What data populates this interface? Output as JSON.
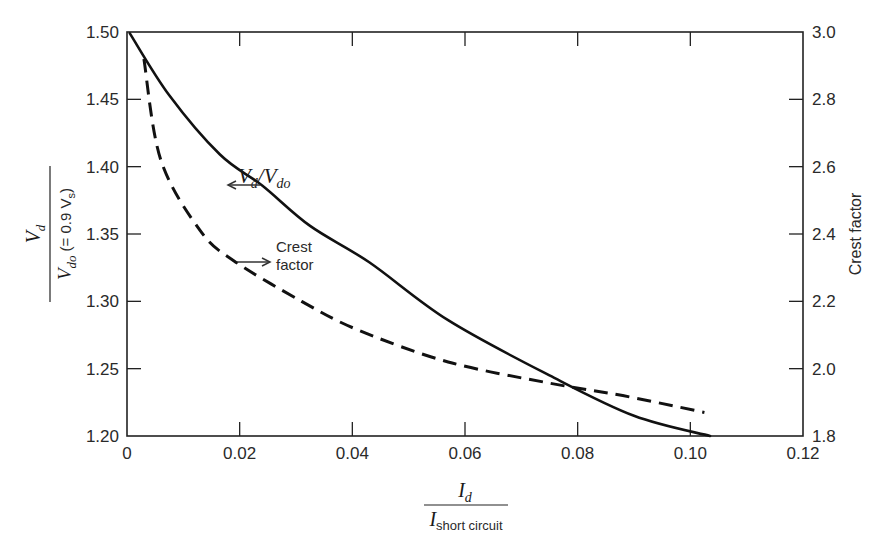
{
  "chart_data": {
    "type": "line",
    "title": "",
    "xlabel": "I_d / I_short circuit",
    "xlabel_parts": {
      "num": "I",
      "num_sub": "d",
      "den": "I",
      "den_sub": "short circuit"
    },
    "ylabel_left": "V_d / V_do (= 0.9 V_s)",
    "ylabel_left_parts": {
      "num": "V",
      "num_sub": "d",
      "den": "V",
      "den_sub": "do",
      "den_suffix": "(= 0.9 V",
      "den_suffix_sub": "s",
      "den_close": ")"
    },
    "ylabel_right": "Crest factor",
    "xlim": [
      0,
      0.12
    ],
    "ylim_left": [
      1.2,
      1.5
    ],
    "ylim_right": [
      1.8,
      3.0
    ],
    "x_ticks": [
      "0",
      "0.02",
      "0.04",
      "0.06",
      "0.08",
      "0.10",
      "0.12"
    ],
    "x_tick_values": [
      0,
      0.02,
      0.04,
      0.06,
      0.08,
      0.1,
      0.12
    ],
    "y_left_ticks": [
      "1.50",
      "1.45",
      "1.40",
      "1.35",
      "1.30",
      "1.25",
      "1.20"
    ],
    "y_left_tick_values": [
      1.5,
      1.45,
      1.4,
      1.35,
      1.3,
      1.25,
      1.2
    ],
    "y_right_ticks": [
      "3.0",
      "2.8",
      "2.6",
      "2.4",
      "2.2",
      "2.0",
      "1.8"
    ],
    "y_right_tick_values": [
      3.0,
      2.8,
      2.6,
      2.4,
      2.2,
      2.0,
      1.8
    ],
    "grid": false,
    "series": [
      {
        "name": "Vd/Vdo",
        "axis": "left",
        "style": "solid",
        "x": [
          0.0005,
          0.0075,
          0.0165,
          0.024,
          0.0325,
          0.043,
          0.057,
          0.075,
          0.09,
          0.1035
        ],
        "y": [
          1.499,
          1.453,
          1.409,
          1.386,
          1.356,
          1.329,
          1.286,
          1.245,
          1.215,
          1.2
        ]
      },
      {
        "name": "Crest factor",
        "axis": "right",
        "style": "dashed",
        "x": [
          0.003,
          0.006,
          0.013,
          0.019,
          0.031,
          0.041,
          0.057,
          0.075,
          0.088,
          0.1025
        ],
        "y": [
          2.92,
          2.62,
          2.41,
          2.32,
          2.2,
          2.115,
          2.02,
          1.957,
          1.92,
          1.87
        ]
      }
    ],
    "annotations": [
      {
        "text": "V_d/V_do",
        "parts": {
          "a": "V",
          "a_sub": "d",
          "slash": "/",
          "b": "V",
          "b_sub": "do"
        },
        "arrow": "left",
        "points_to_axis": "left"
      },
      {
        "text": "Crest factor",
        "line1": "Crest",
        "line2": "factor",
        "arrow": "right",
        "points_to_axis": "right"
      }
    ],
    "legend": null
  },
  "colors": {
    "line": "#111111",
    "axis": "#222222",
    "background": "#ffffff"
  }
}
